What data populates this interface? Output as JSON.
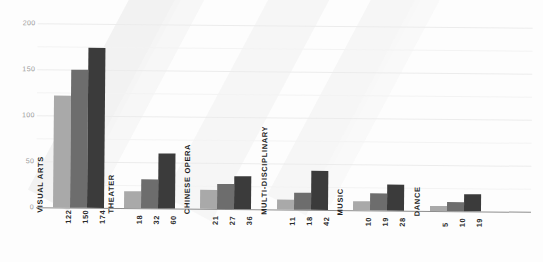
{
  "chart_data": {
    "type": "bar",
    "title": "",
    "xlabel": "",
    "ylabel": "",
    "ylim": [
      0,
      200
    ],
    "yticks": [
      0,
      50,
      100,
      150,
      200
    ],
    "ytick_labels": [
      "0",
      "50",
      "100",
      "150",
      "200"
    ],
    "grid": true,
    "legend": "none",
    "orientation": "vertical",
    "grouping": "grouped",
    "categories": [
      "VISUAL ARTS",
      "THEATER",
      "CHINESE OPERA",
      "MULTI-DISCIPLINARY",
      "MUSIC",
      "DANCE"
    ],
    "series": [
      {
        "name": "series-1",
        "color": "#a9a9a9",
        "values": [
          122,
          18,
          21,
          11,
          10,
          5
        ]
      },
      {
        "name": "series-2",
        "color": "#6d6d6d",
        "values": [
          150,
          32,
          27,
          18,
          19,
          10
        ]
      },
      {
        "name": "series-3",
        "color": "#3b3b3b",
        "values": [
          174,
          60,
          36,
          42,
          28,
          19
        ]
      }
    ],
    "data_labels": [
      [
        "122",
        "150",
        "174"
      ],
      [
        "18",
        "32",
        "60"
      ],
      [
        "21",
        "27",
        "36"
      ],
      [
        "11",
        "18",
        "42"
      ],
      [
        "10",
        "19",
        "28"
      ],
      [
        "5",
        "10",
        "19"
      ]
    ]
  },
  "colors": {
    "series_light": "#a9a9a9",
    "series_mid": "#6d6d6d",
    "series_dark": "#3b3b3b",
    "gridline": "#ececec",
    "axis": "#8d8d8d",
    "tick_text": "#9a9a9a",
    "label_text": "#1d1d1d",
    "background": "#fdfdfd",
    "watermark": "#f0f0f0"
  }
}
